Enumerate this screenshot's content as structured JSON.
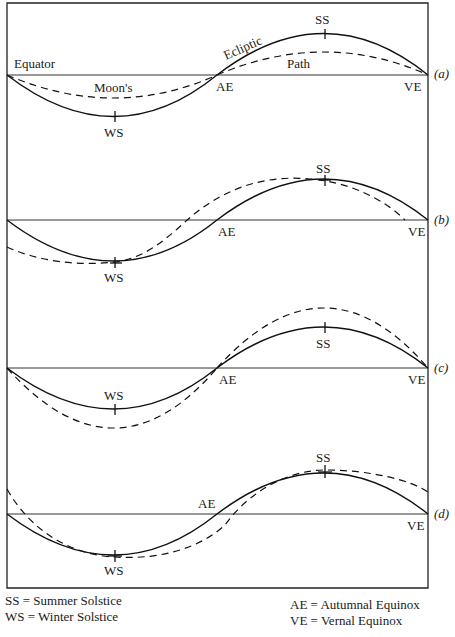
{
  "panels": [
    {
      "id": "a",
      "label": "(a)",
      "equator_label": "Equator",
      "ecliptic_label": "Ecliptic",
      "moon_label_1": "Moon's",
      "moon_label_2": "Path",
      "ss": "SS",
      "ws": "WS",
      "ae": "AE",
      "ve": "VE"
    },
    {
      "id": "b",
      "label": "(b)",
      "ss": "SS",
      "ws": "WS",
      "ae": "AE",
      "ve": "VE"
    },
    {
      "id": "c",
      "label": "(c)",
      "ss": "SS",
      "ws": "WS",
      "ae": "AE",
      "ve": "VE"
    },
    {
      "id": "d",
      "label": "(d)",
      "ss": "SS",
      "ws": "WS",
      "ae": "AE",
      "ve": "VE"
    }
  ],
  "legend": {
    "left": [
      "SS = Summer Solstice",
      "WS = Winter Solstice"
    ],
    "right": [
      "AE = Autumnal Equinox",
      "VE = Vernal Equinox"
    ]
  }
}
